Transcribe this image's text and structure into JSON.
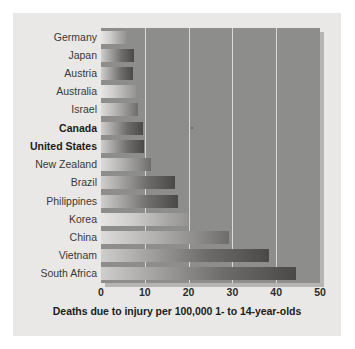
{
  "chart_data": {
    "type": "bar",
    "orientation": "horizontal",
    "title": "",
    "caption": "Deaths due to injury per 100,000 1- to 14-year-olds",
    "xlabel": "Deaths due to injury per 100,000 1- to 14-year-olds",
    "ylabel": "",
    "xlim": [
      0,
      50
    ],
    "xticks": [
      0,
      10,
      20,
      30,
      40,
      50
    ],
    "xtick_labels": [
      "0",
      "10",
      "20",
      "30",
      "40",
      "50"
    ],
    "grid": "vertical",
    "legend": "none",
    "categories": [
      "Germany",
      "Japan",
      "Austria",
      "Australia",
      "Israel",
      "Canada",
      "United States",
      "New Zealand",
      "Brazil",
      "Philippines",
      "Korea",
      "China",
      "Vietnam",
      "South Africa"
    ],
    "values": [
      5.7,
      7.5,
      7.4,
      8.0,
      8.4,
      9.6,
      9.8,
      11.4,
      16.8,
      17.5,
      19.8,
      29.3,
      38.4,
      44.5
    ],
    "highlighted": [
      "Canada",
      "United States"
    ],
    "colors": {
      "plot_background": "#8d8d8b",
      "panel_background": "#e9e8e6",
      "gridline": "#d8d8d6",
      "bar_light": "#cfcecc",
      "bar_dark": "#4a4947",
      "text": "#3a3937"
    }
  }
}
